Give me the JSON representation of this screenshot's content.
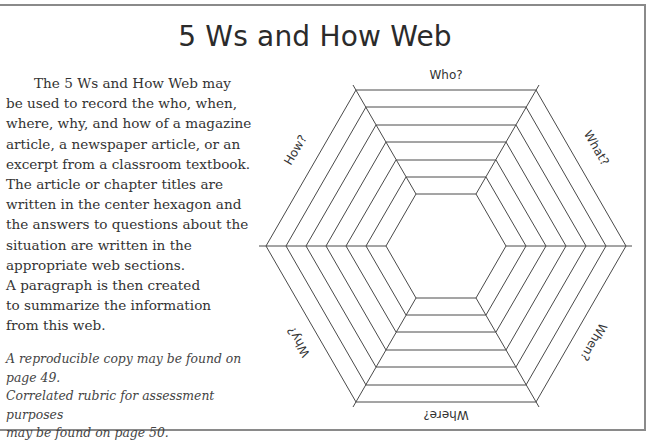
{
  "title": "5 Ws and How Web",
  "description": {
    "lines": [
      "The 5 Ws and How Web may",
      "be used to record the who, when,",
      "where, why, and how of a magazine",
      "article, a newspaper article, or an",
      "excerpt from a classroom textbook.",
      "The article or chapter titles are",
      "written in the center hexagon and",
      "the answers to questions about the",
      "situation are written in the",
      "appropriate web sections.",
      "A paragraph is then created",
      "to summarize the information",
      "from this web."
    ]
  },
  "notes": {
    "line1": "A reproducible copy may be found on page 49.",
    "line2": "Correlated rubric for assessment purposes",
    "line3": "may be found on page 50."
  },
  "web": {
    "ring_count": 7,
    "labels": {
      "top": "Who?",
      "upper_right": "What?",
      "lower_right": "When?",
      "bottom": "Where?",
      "lower_left": "Why?",
      "upper_left": "How?"
    },
    "center_area": "article or chapter title"
  }
}
